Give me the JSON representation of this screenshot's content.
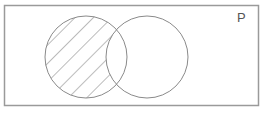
{
  "diagram": {
    "type": "venn",
    "universe_label": "P",
    "sets": [
      {
        "name": "left-circle",
        "cx": 86,
        "cy": 57,
        "r": 41
      },
      {
        "name": "right-circle",
        "cx": 147,
        "cy": 57,
        "r": 41
      }
    ],
    "shaded_region": "left circle only (left minus intersection)",
    "shading_style": "diagonal hatch",
    "colors": {
      "stroke": "#8a8a8a",
      "frame": "#9a9a9a",
      "background": "#ffffff"
    }
  }
}
